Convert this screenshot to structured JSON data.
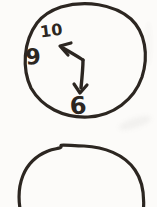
{
  "canvas": {
    "background": "#fcfbf9",
    "ink": "#2c2621"
  },
  "top_clock": {
    "numeral_ten": "10",
    "numeral_nine": "9",
    "numeral_six": "6"
  }
}
